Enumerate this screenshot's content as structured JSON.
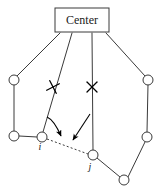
{
  "figure": {
    "title_box": {
      "label": "Center",
      "x": 55,
      "y": 8,
      "width": 54,
      "height": 24,
      "stroke": "#3a3a3a",
      "fill": "#ffffff"
    },
    "colors": {
      "stroke": "#3a3a3a",
      "node_fill": "#ffffff",
      "arrow": "#000000",
      "dashed": "#3a3a3a",
      "text": "#1a1a1a"
    },
    "nodes": [
      {
        "id": "n_left_top",
        "name": "node-left-top",
        "cx": 14,
        "cy": 80,
        "r": 5,
        "label": ""
      },
      {
        "id": "n_left_bottom",
        "name": "node-left-bottom",
        "cx": 14,
        "cy": 136,
        "r": 5,
        "label": ""
      },
      {
        "id": "n_i",
        "name": "node-i",
        "cx": 42,
        "cy": 137,
        "r": 5,
        "label": "i",
        "label_x": 40,
        "label_y": 150
      },
      {
        "id": "n_j",
        "name": "node-j",
        "cx": 93,
        "cy": 155,
        "r": 5,
        "label": "j",
        "label_x": 90,
        "label_y": 170
      },
      {
        "id": "n_bottom",
        "name": "node-bottom",
        "cx": 124,
        "cy": 180,
        "r": 5,
        "label": ""
      },
      {
        "id": "n_right_bottom",
        "name": "node-right-bottom",
        "cx": 147,
        "cy": 137,
        "r": 5,
        "label": ""
      },
      {
        "id": "n_right_top",
        "name": "node-right-top",
        "cx": 148,
        "cy": 80,
        "r": 5,
        "label": ""
      }
    ],
    "edges": [
      {
        "name": "edge-center-to-left-top",
        "x1": 60,
        "y1": 33,
        "x2": 17,
        "y2": 76
      },
      {
        "name": "edge-center-to-node-i",
        "x1": 72,
        "y1": 33,
        "x2": 43,
        "y2": 132
      },
      {
        "name": "edge-center-to-node-j",
        "x1": 92,
        "y1": 33,
        "x2": 93,
        "y2": 150
      },
      {
        "name": "edge-center-to-right-top",
        "x1": 106,
        "y1": 33,
        "x2": 145,
        "y2": 76
      },
      {
        "name": "edge-left-top-to-left-bottom",
        "x1": 14,
        "y1": 85,
        "x2": 14,
        "y2": 131
      },
      {
        "name": "edge-left-bottom-to-node-i",
        "x1": 19,
        "y1": 136,
        "x2": 37,
        "y2": 137
      },
      {
        "name": "edge-node-j-to-bottom",
        "x1": 97,
        "y1": 158,
        "x2": 120,
        "y2": 177
      },
      {
        "name": "edge-bottom-to-right-bottom",
        "x1": 128,
        "y1": 177,
        "x2": 145,
        "y2": 142
      },
      {
        "name": "edge-right-bottom-to-right-top",
        "x1": 147,
        "y1": 132,
        "x2": 148,
        "y2": 85
      }
    ],
    "dashed_edges": [
      {
        "name": "dashed-edge-i-to-j",
        "x1": 47,
        "y1": 139,
        "x2": 88,
        "y2": 154
      }
    ],
    "cut_marks": [
      {
        "name": "cut-mark-left",
        "cx": 53,
        "cy": 87,
        "size": 5,
        "rotation": 18
      },
      {
        "name": "cut-mark-right",
        "cx": 92,
        "cy": 87,
        "size": 5,
        "rotation": 0
      }
    ],
    "arrows": [
      {
        "name": "arrow-left-to-dashed",
        "path": "M 47 117 Q 54 120 61 136",
        "tip_x": 61,
        "tip_y": 139
      },
      {
        "name": "arrow-right-to-dashed",
        "path": "M 90 114 L 73 140",
        "tip_x": 71,
        "tip_y": 143
      }
    ]
  }
}
